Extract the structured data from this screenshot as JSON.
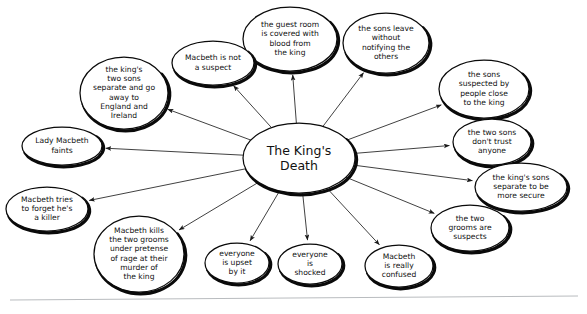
{
  "diagram": {
    "type": "mind-map",
    "center": {
      "id": "center",
      "text": "The King's Death",
      "lines": [
        "The King's",
        "Death"
      ],
      "cx": 299,
      "cy": 158,
      "rx": 56,
      "ry": 35
    },
    "nodes": [
      {
        "id": "guest-room-blood",
        "text": "the guest room is covered with blood from the king",
        "lines": [
          "the guest room",
          "is covered with",
          "blood from",
          "the king"
        ],
        "cx": 290,
        "cy": 39,
        "rx": 47,
        "ry": 32
      },
      {
        "id": "sons-leave-without-notifying",
        "text": "the sons leave without notifying the others",
        "lines": [
          "the sons leave",
          "without",
          "notifying the",
          "others"
        ],
        "cx": 386,
        "cy": 43,
        "rx": 43,
        "ry": 30
      },
      {
        "id": "macbeth-not-suspect",
        "text": "Macbeth is not a suspect",
        "lines": [
          "Macbeth is not",
          "a suspect"
        ],
        "cx": 213,
        "cy": 63,
        "rx": 41,
        "ry": 22
      },
      {
        "id": "kings-sons-separate-england-ireland",
        "text": "the king's two sons separate and go away to England and Ireland",
        "lines": [
          "the king's",
          "two sons",
          "separate and go",
          "away to",
          "England and",
          "Ireland"
        ],
        "cx": 124,
        "cy": 93,
        "rx": 44,
        "ry": 36
      },
      {
        "id": "sons-suspected-by-people",
        "text": "the sons suspected by people close to the king",
        "lines": [
          "the sons",
          "suspected by",
          "people close",
          "to the king"
        ],
        "cx": 484,
        "cy": 89,
        "rx": 45,
        "ry": 29
      },
      {
        "id": "lady-macbeth-faints",
        "text": "Lady Macbeth faints",
        "lines": [
          "Lady Macbeth",
          "faints"
        ],
        "cx": 62,
        "cy": 146,
        "rx": 40,
        "ry": 19
      },
      {
        "id": "two-sons-dont-trust",
        "text": "the two sons don't trust anyone",
        "lines": [
          "the two sons",
          "don't trust",
          "anyone"
        ],
        "cx": 492,
        "cy": 142,
        "rx": 39,
        "ry": 23
      },
      {
        "id": "kings-sons-separate-secure",
        "text": "the king's sons separate to be more secure",
        "lines": [
          "the king's sons",
          "separate to be",
          "more secure"
        ],
        "cx": 521,
        "cy": 187,
        "rx": 46,
        "ry": 24
      },
      {
        "id": "macbeth-forget-killer",
        "text": "Macbeth tries to forget he's a killer",
        "lines": [
          "Macbeth tries",
          "to forget he's",
          "a killer"
        ],
        "cx": 47,
        "cy": 209,
        "rx": 41,
        "ry": 22
      },
      {
        "id": "two-grooms-suspects",
        "text": "the two grooms are suspects",
        "lines": [
          "the two",
          "grooms are",
          "suspects"
        ],
        "cx": 470,
        "cy": 228,
        "rx": 39,
        "ry": 23
      },
      {
        "id": "macbeth-kills-grooms",
        "text": "Macbeth kills the two grooms under pretense of rage at their murder of the king",
        "lines": [
          "Macbeth kills",
          "the two grooms",
          "under pretense",
          "of rage at their",
          "murder of",
          "the king"
        ],
        "cx": 139,
        "cy": 254,
        "rx": 45,
        "ry": 38
      },
      {
        "id": "everyone-upset",
        "text": "everyone is upset by it",
        "lines": [
          "everyone",
          "is upset",
          "by it"
        ],
        "cx": 237,
        "cy": 263,
        "rx": 32,
        "ry": 20
      },
      {
        "id": "everyone-shocked",
        "text": "everyone is shocked",
        "lines": [
          "everyone",
          "is",
          "shocked"
        ],
        "cx": 310,
        "cy": 264,
        "rx": 32,
        "ry": 20
      },
      {
        "id": "macbeth-really-confused",
        "text": "Macbeth is really confused",
        "lines": [
          "Macbeth",
          "is really",
          "confused"
        ],
        "cx": 399,
        "cy": 266,
        "rx": 34,
        "ry": 21
      }
    ],
    "edges": [
      {
        "from": "center",
        "to": "guest-room-blood"
      },
      {
        "from": "center",
        "to": "sons-leave-without-notifying"
      },
      {
        "from": "center",
        "to": "macbeth-not-suspect"
      },
      {
        "from": "center",
        "to": "kings-sons-separate-england-ireland"
      },
      {
        "from": "center",
        "to": "sons-suspected-by-people"
      },
      {
        "from": "center",
        "to": "lady-macbeth-faints"
      },
      {
        "from": "center",
        "to": "two-sons-dont-trust"
      },
      {
        "from": "center",
        "to": "kings-sons-separate-secure"
      },
      {
        "from": "center",
        "to": "macbeth-forget-killer"
      },
      {
        "from": "center",
        "to": "two-grooms-suspects"
      },
      {
        "from": "center",
        "to": "macbeth-kills-grooms"
      },
      {
        "from": "center",
        "to": "everyone-upset"
      },
      {
        "from": "center",
        "to": "everyone-shocked"
      },
      {
        "from": "center",
        "to": "macbeth-really-confused"
      }
    ],
    "colors": {
      "background": "#ffffff",
      "node_fill": "#ffffff",
      "node_stroke": "#0a0a0a",
      "text": "#111111",
      "edge": "#2b2b2b",
      "rule": "#b9bcbf"
    },
    "baseline_rule": {
      "x1": 10,
      "y1": 300,
      "x2": 578,
      "y2": 296
    }
  }
}
